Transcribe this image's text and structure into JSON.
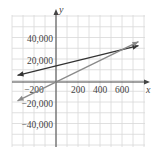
{
  "chart_data": {
    "type": "line",
    "title": "",
    "xlabel": "x",
    "ylabel": "y",
    "xlim": [
      -400,
      800
    ],
    "ylim": [
      -60000,
      60000
    ],
    "grid": true,
    "x_ticks": [
      -200,
      200,
      400,
      600
    ],
    "x_tick_labels": [
      "−200",
      "200",
      "400",
      "600"
    ],
    "y_ticks": [
      40000,
      20000,
      -20000,
      -40000
    ],
    "y_tick_labels": [
      "40,000",
      "20,000",
      "−20,000",
      "−40,000"
    ],
    "series": [
      {
        "name": "line-1",
        "equation": "y = 25x + 15000",
        "color": "#333333",
        "x": [
          -350,
          750
        ],
        "y": [
          6250,
          33750
        ]
      },
      {
        "name": "line-2",
        "equation": "y = 50x",
        "color": "#8a8a8a",
        "x": [
          -350,
          750
        ],
        "y": [
          -17500,
          37500
        ]
      }
    ],
    "intersection": {
      "x": 600,
      "y": 30000
    }
  },
  "colors": {
    "grid": "#d8d8d8",
    "axis": "#444444",
    "line_dark": "#333333",
    "line_gray": "#8a8a8a"
  }
}
